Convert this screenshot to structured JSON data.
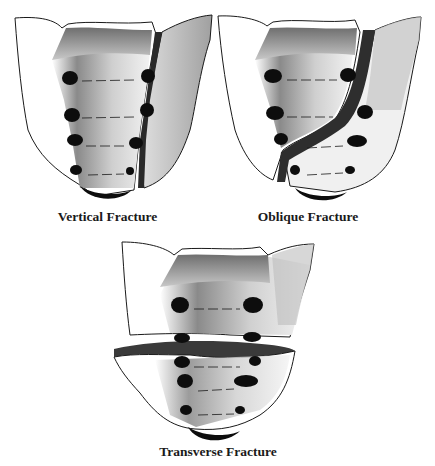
{
  "figure": {
    "panels": [
      {
        "id": "vertical",
        "caption": "Vertical Fracture"
      },
      {
        "id": "oblique",
        "caption": "Oblique Fracture"
      },
      {
        "id": "transverse",
        "caption": "Transverse Fracture"
      }
    ]
  },
  "colors": {
    "background": "#ffffff",
    "outline": "#1a1a1a",
    "foramen": "#0d0d0d",
    "fracture_fill": "#3a3a3a",
    "shade_dark": "#7a7a7a",
    "shade_light": "#f2f2f2"
  }
}
